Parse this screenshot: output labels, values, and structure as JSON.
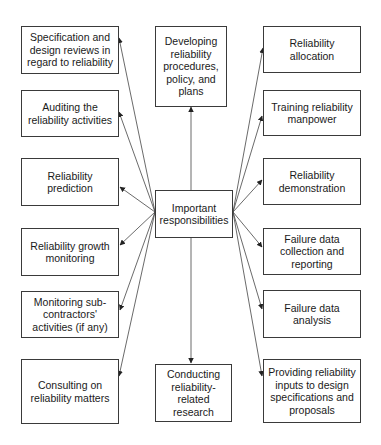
{
  "diagram": {
    "center": {
      "label": "Important responsibilities"
    },
    "top": {
      "label": "Developing reliability procedures, policy, and plans"
    },
    "bottom": {
      "label": "Conducting reliability-related research"
    },
    "left": [
      {
        "label": "Specification and design reviews in regard to reliability"
      },
      {
        "label": "Auditing the reliability activities"
      },
      {
        "label": "Reliability prediction"
      },
      {
        "label": "Reliability growth monitoring"
      },
      {
        "label": "Monitoring sub-contractors' activities (if any)"
      },
      {
        "label": "Consulting on reliability matters"
      }
    ],
    "right": [
      {
        "label": "Reliability allocation"
      },
      {
        "label": "Training reliability manpower"
      },
      {
        "label": "Reliability demonstration"
      },
      {
        "label": "Failure data collection and reporting"
      },
      {
        "label": "Failure data analysis"
      },
      {
        "label": "Providing reliability inputs to design specifications and proposals"
      }
    ],
    "line_color": "#3a3a3a"
  }
}
